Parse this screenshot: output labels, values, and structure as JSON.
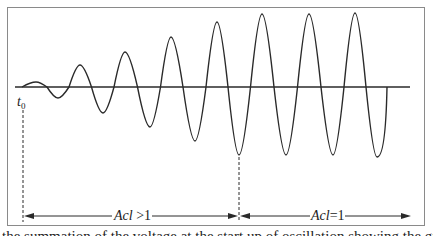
{
  "diagram": {
    "start_label": {
      "main": "t",
      "subscript": "0"
    },
    "regions": [
      {
        "label_prefix": "Acl",
        "label_suffix": " >1",
        "description": "loop gain greater than one, amplitude grows"
      },
      {
        "label_prefix": "Acl",
        "label_suffix": "=1",
        "description": "loop gain equal to one, steady amplitude"
      }
    ],
    "colors": {
      "stroke": "#2a2a2a",
      "frame": "#8a8a8a",
      "background": "#ffffff"
    },
    "waveform": {
      "baseline_y": 87,
      "cycles": [
        {
          "peak_x": 36,
          "peak_y": 82,
          "trough_x": 58,
          "trough_y": 98
        },
        {
          "peak_x": 80,
          "peak_y": 65,
          "trough_x": 103,
          "trough_y": 113
        },
        {
          "peak_x": 125,
          "peak_y": 52,
          "trough_x": 150,
          "trough_y": 127
        },
        {
          "peak_x": 171,
          "peak_y": 37,
          "trough_x": 195,
          "trough_y": 141
        },
        {
          "peak_x": 217,
          "peak_y": 22,
          "trough_x": 239,
          "trough_y": 155
        },
        {
          "peak_x": 262,
          "peak_y": 14,
          "trough_x": 286,
          "trough_y": 155
        },
        {
          "peak_x": 309,
          "peak_y": 14,
          "trough_x": 333,
          "trough_y": 155
        },
        {
          "peak_x": 355,
          "peak_y": 13,
          "trough_x": 377,
          "trough_y": 157
        }
      ]
    }
  },
  "caption": {
    "text": "the summation of the voltage at the start up of oscillation showing the gradual growth to steady state conditions"
  }
}
